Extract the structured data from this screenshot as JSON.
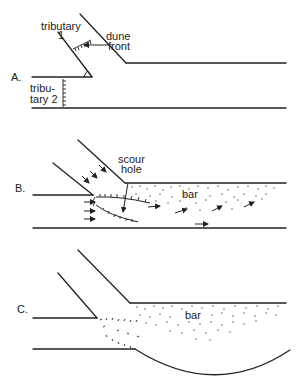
{
  "figure": {
    "panels": [
      {
        "id": "A",
        "label": "A.",
        "annotations": {
          "tributary1": [
            "tributary",
            "1"
          ],
          "dune_front": [
            "dune",
            "front"
          ],
          "tributary2": [
            "tribu-",
            "tary 2"
          ]
        }
      },
      {
        "id": "B",
        "label": "B.",
        "annotations": {
          "scour_hole": [
            "scour",
            "hole"
          ],
          "bar": "bar"
        }
      },
      {
        "id": "C",
        "label": "C.",
        "annotations": {
          "bar": "bar"
        }
      }
    ]
  },
  "colors": {
    "line": "#222222",
    "background": "#ffffff"
  }
}
